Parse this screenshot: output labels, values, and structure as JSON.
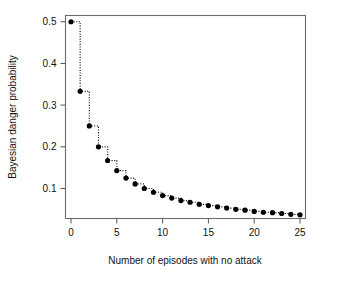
{
  "chart_data": {
    "type": "line",
    "title": "",
    "subtitle": "",
    "xlabel": "Number of episodes with no attack",
    "ylabel": "Bayesian danger probability",
    "xlim": [
      -0.6,
      25.6
    ],
    "ylim": [
      0.028,
      0.515
    ],
    "grid": false,
    "legend": null,
    "x_ticks": [
      0,
      5,
      10,
      15,
      20,
      25
    ],
    "x_tick_labels": [
      "0",
      "5",
      "10",
      "15",
      "20",
      "25"
    ],
    "y_ticks": [
      0.1,
      0.2,
      0.3,
      0.4,
      0.5
    ],
    "y_tick_labels": [
      "0.1",
      "0.2",
      "0.3",
      "0.4",
      "0.5"
    ],
    "marker": "filled-circle",
    "line_style": "dotted-step",
    "series": [
      {
        "name": "Bayesian danger probability",
        "x": [
          0,
          1,
          2,
          3,
          4,
          5,
          6,
          7,
          8,
          9,
          10,
          11,
          12,
          13,
          14,
          15,
          16,
          17,
          18,
          19,
          20,
          21,
          22,
          23,
          24,
          25
        ],
        "values": [
          0.5,
          0.333,
          0.25,
          0.2,
          0.167,
          0.143,
          0.125,
          0.111,
          0.1,
          0.091,
          0.083,
          0.077,
          0.071,
          0.067,
          0.062,
          0.059,
          0.056,
          0.053,
          0.05,
          0.048,
          0.045,
          0.043,
          0.042,
          0.04,
          0.038,
          0.037
        ]
      }
    ]
  },
  "axes": {
    "y_label": "Bayesian danger probability",
    "x_label": "Number of episodes with no attack"
  }
}
